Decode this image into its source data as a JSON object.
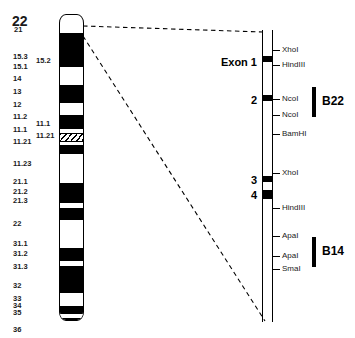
{
  "figure": {
    "width": 355,
    "height": 338,
    "background": "#ffffff",
    "ink": "#000000"
  },
  "ideogram": {
    "title": "22",
    "bands": [
      {
        "label": "21",
        "label_x": 14,
        "label_y": 44,
        "top": 32,
        "height": 34,
        "stain": "dark"
      },
      {
        "label": "15.3",
        "label_x": 13,
        "label_y": 71,
        "top": 66,
        "height": 7,
        "stain": "light"
      },
      {
        "label": "15.2",
        "label_x": 36,
        "label_y": 75,
        "top": 73,
        "height": 5,
        "stain": "light"
      },
      {
        "label": "15.1",
        "label_x": 13,
        "label_y": 81,
        "top": 78,
        "height": 6,
        "stain": "light"
      },
      {
        "label": "14",
        "label_x": 13,
        "label_y": 93,
        "top": 84,
        "height": 18,
        "stain": "dark"
      },
      {
        "label": "13",
        "label_x": 13,
        "label_y": 106,
        "top": 102,
        "height": 12,
        "stain": "light"
      },
      {
        "label": "12",
        "label_x": 13,
        "label_y": 119,
        "top": 114,
        "height": 14,
        "stain": "dark"
      },
      {
        "label": "11.2",
        "label_x": 13,
        "label_y": 131,
        "top": 128,
        "height": 4,
        "stain": "light"
      },
      {
        "label": "11.1",
        "label_x": 13,
        "label_y": 144,
        "top": 132,
        "height": 9,
        "stain": "hatch"
      },
      {
        "label": "11.1",
        "label_x": 36,
        "label_y": 138,
        "top": 141,
        "height": 3,
        "stain": "light"
      },
      {
        "label": "11.21",
        "label_x": 13,
        "label_y": 156,
        "top": 144,
        "height": 9,
        "stain": "dark"
      },
      {
        "label": "11.21",
        "label_x": 36,
        "label_y": 150,
        "top": 153,
        "height": 3,
        "stain": "light"
      },
      {
        "label": "11.23",
        "label_x": 13,
        "label_y": 178,
        "top": 156,
        "height": 26,
        "stain": "light"
      },
      {
        "label": "21.1",
        "label_x": 13,
        "label_y": 196,
        "top": 182,
        "height": 20,
        "stain": "dark"
      },
      {
        "label": "21.2",
        "label_x": 13,
        "label_y": 206,
        "top": 202,
        "height": 5,
        "stain": "light"
      },
      {
        "label": "21.3",
        "label_x": 13,
        "label_y": 215,
        "top": 207,
        "height": 12,
        "stain": "dark"
      },
      {
        "label": "22",
        "label_x": 13,
        "label_y": 238,
        "top": 219,
        "height": 28,
        "stain": "light"
      },
      {
        "label": "31.1",
        "label_x": 13,
        "label_y": 258,
        "top": 247,
        "height": 13,
        "stain": "dark"
      },
      {
        "label": "31.2",
        "label_x": 13,
        "label_y": 268,
        "top": 260,
        "height": 5,
        "stain": "light"
      },
      {
        "label": "31.3",
        "label_x": 13,
        "label_y": 281,
        "top": 265,
        "height": 27,
        "stain": "dark"
      },
      {
        "label": "32",
        "label_x": 13,
        "label_y": 300,
        "top": 292,
        "height": 13,
        "stain": "light"
      },
      {
        "label": "33",
        "label_x": 13,
        "label_y": 313,
        "top": 305,
        "height": 8,
        "stain": "dark"
      },
      {
        "label": "34",
        "label_x": 13,
        "label_y": 320,
        "top": 313,
        "height": 4,
        "stain": "light"
      },
      {
        "label": "35",
        "label_x": 13,
        "label_y": 327,
        "top": 317,
        "height": 8,
        "stain": "dark"
      },
      {
        "label": "36",
        "label_x": 13,
        "label_y": 344,
        "top": 325,
        "height": 16,
        "stain": "light"
      }
    ]
  },
  "connectors": {
    "style": "dashed",
    "lines": [
      {
        "name": "upper-connector",
        "x1": 83,
        "y1": 26,
        "x2": 263,
        "y2": 32
      },
      {
        "name": "lower-connector",
        "x1": 83,
        "y1": 36,
        "x2": 265,
        "y2": 321
      }
    ]
  },
  "gene_map": {
    "exons": [
      {
        "label": "Exon 1",
        "y": 62,
        "block_top": 56,
        "block_height": 6
      },
      {
        "label": "2",
        "y": 100,
        "block_top": 95,
        "block_height": 6
      },
      {
        "label": "3",
        "y": 180,
        "block_top": 176,
        "block_height": 6
      },
      {
        "label": "4",
        "y": 195,
        "block_top": 190,
        "block_height": 9
      }
    ],
    "restriction_sites": [
      {
        "label": "XhoI",
        "y": 50
      },
      {
        "label": "HindIII",
        "y": 65
      },
      {
        "label": "NcoI",
        "y": 99
      },
      {
        "label": "NcoI",
        "y": 115
      },
      {
        "label": "BamHI",
        "y": 134
      },
      {
        "label": "XhoI",
        "y": 173
      },
      {
        "label": "HindIII",
        "y": 208
      },
      {
        "label": "ApaI",
        "y": 236
      },
      {
        "label": "ApaI",
        "y": 256
      },
      {
        "label": "SmaI",
        "y": 269
      }
    ]
  },
  "probes": [
    {
      "label": "B22",
      "bar_x": 312,
      "bar_y": 87,
      "bar_height": 30,
      "label_x": 322,
      "label_y": 95
    },
    {
      "label": "B14",
      "bar_x": 312,
      "bar_y": 237,
      "bar_height": 30,
      "label_x": 322,
      "label_y": 245
    }
  ]
}
